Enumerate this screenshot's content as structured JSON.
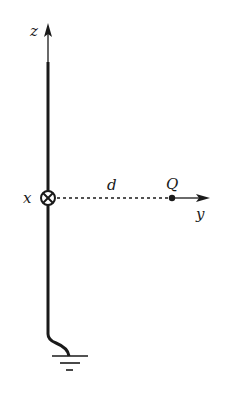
{
  "diagram": {
    "axes": {
      "z_label": "z",
      "x_label": "x",
      "y_label": "y"
    },
    "labels": {
      "distance": "d",
      "charge": "Q"
    },
    "elements": [
      {
        "name": "grounded-wire",
        "description": "vertical conductor along z-axis, grounded at bottom"
      },
      {
        "name": "current-into-page",
        "description": "circled cross at origin indicating x-axis into page"
      },
      {
        "name": "point-charge",
        "description": "charge Q at distance d along y-axis"
      },
      {
        "name": "ground-symbol",
        "description": "earth ground"
      }
    ],
    "colors": {
      "ink": "#1a1a1a",
      "background": "#ffffff"
    }
  }
}
